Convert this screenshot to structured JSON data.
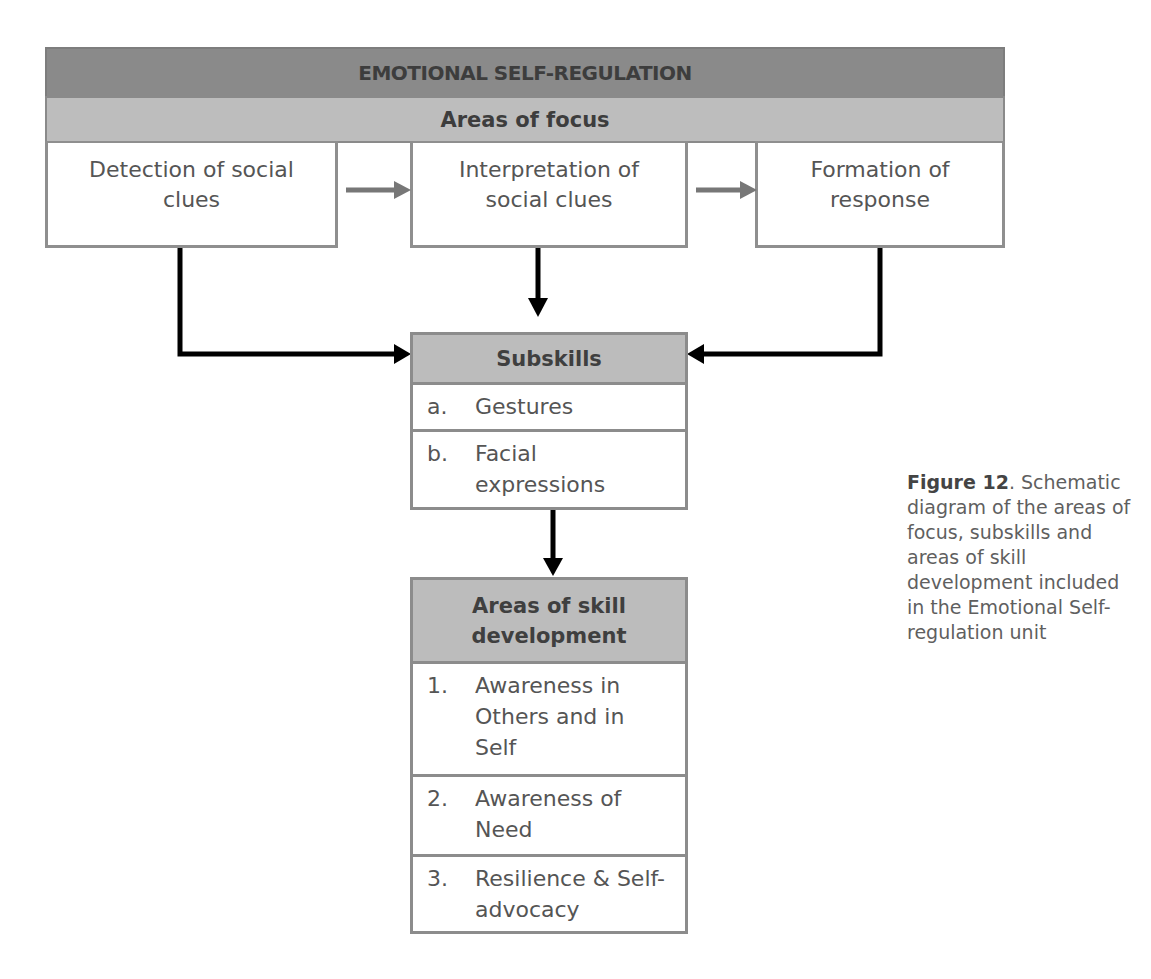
{
  "diagram": {
    "title": "EMOTIONAL SELF-REGULATION",
    "areas_of_focus": {
      "label": "Areas of focus",
      "items": [
        {
          "label": "Detection of social clues"
        },
        {
          "label": "Interpretation of social clues"
        },
        {
          "label": "Formation of response"
        }
      ]
    },
    "subskills": {
      "label": "Subskills",
      "items": [
        {
          "marker": "a.",
          "label": "Gestures"
        },
        {
          "marker": "b.",
          "label": "Facial expressions"
        }
      ]
    },
    "skill_development": {
      "label": "Areas of skill development",
      "items": [
        {
          "marker": "1.",
          "label": "Awareness in Others and in Self"
        },
        {
          "marker": "2.",
          "label": "Awareness of Need"
        },
        {
          "marker": "3.",
          "label": "Resilience & Self-advocacy"
        }
      ]
    },
    "colors": {
      "title_band": "#8a8a8a",
      "subheader_band": "#bdbdbd",
      "border": "#8a8a8a",
      "flow_arrow": "#777777",
      "connector_arrow": "#000000"
    }
  },
  "caption": {
    "figure_label": "Figure 12",
    "figure_punct": ".",
    "text": "Schematic diagram of the areas of focus, subskills and areas of skill development included in the Emotional Self-regulation unit"
  }
}
